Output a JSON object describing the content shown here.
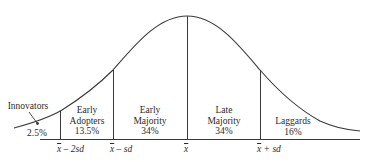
{
  "diagram": {
    "curve": "normal distribution (bell curve)",
    "categories": [
      {
        "name_line1": "Innovators",
        "name_line2": "",
        "percent": "2.5%"
      },
      {
        "name_line1": "Early",
        "name_line2": "Adopters",
        "percent": "13.5%"
      },
      {
        "name_line1": "Early",
        "name_line2": "Majority",
        "percent": "34%"
      },
      {
        "name_line1": "Late",
        "name_line2": "Majority",
        "percent": "34%"
      },
      {
        "name_line1": "Laggards",
        "name_line2": "",
        "percent": "16%"
      }
    ],
    "axis_ticks": [
      {
        "mean_symbol": "x",
        "suffix": " – 2sd"
      },
      {
        "mean_symbol": "x",
        "suffix": " – sd"
      },
      {
        "mean_symbol": "x",
        "suffix": ""
      },
      {
        "mean_symbol": "x",
        "suffix": " + sd"
      }
    ],
    "colors": {
      "line": "#3a3a3a",
      "background": "#ffffff"
    }
  }
}
